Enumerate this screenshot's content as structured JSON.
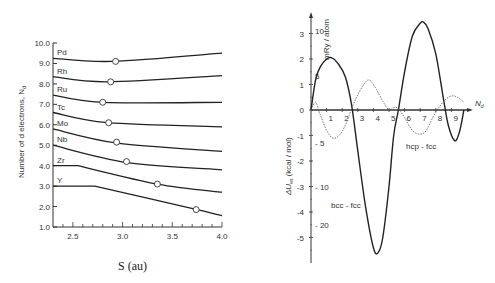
{
  "chart_data": [
    {
      "type": "line",
      "title": "",
      "xlabel": "S (au)",
      "ylabel": "Number of d electrons, N_d",
      "xlim": [
        2.3,
        4.0
      ],
      "ylim": [
        1.0,
        10.0
      ],
      "xticks": [
        "2.5",
        "3.0",
        "3.5",
        "4.0"
      ],
      "yticks": [
        "1.0",
        "2.0",
        "3.0",
        "4.0",
        "5.0",
        "6.0",
        "7.0",
        "8.0",
        "9.0",
        "10.0"
      ],
      "grid": false,
      "series": [
        {
          "name": "Pd",
          "x": [
            2.3,
            2.9,
            4.0
          ],
          "y": [
            9.25,
            9.1,
            9.5
          ],
          "marker": {
            "x": 2.93,
            "y": 9.1
          }
        },
        {
          "name": "Rh",
          "x": [
            2.3,
            2.85,
            4.0
          ],
          "y": [
            8.35,
            8.1,
            8.4
          ],
          "marker": {
            "x": 2.88,
            "y": 8.1
          }
        },
        {
          "name": "Ru",
          "x": [
            2.3,
            2.8,
            4.0
          ],
          "y": [
            7.45,
            7.1,
            7.1
          ],
          "marker": {
            "x": 2.8,
            "y": 7.1
          }
        },
        {
          "name": "Tc",
          "x": [
            2.3,
            2.85,
            4.0
          ],
          "y": [
            6.6,
            6.1,
            5.9
          ],
          "marker": {
            "x": 2.86,
            "y": 6.1
          }
        },
        {
          "name": "Mo",
          "x": [
            2.3,
            2.95,
            4.0
          ],
          "y": [
            5.8,
            5.1,
            4.7
          ],
          "marker": {
            "x": 2.94,
            "y": 5.15
          }
        },
        {
          "name": "Nb",
          "x": [
            2.3,
            3.05,
            4.0
          ],
          "y": [
            5.0,
            4.15,
            3.8
          ],
          "marker": {
            "x": 3.04,
            "y": 4.2
          }
        },
        {
          "name": "Zr",
          "x": [
            2.3,
            2.55,
            3.35,
            4.0
          ],
          "y": [
            4.0,
            4.0,
            3.1,
            2.7
          ],
          "marker": {
            "x": 3.35,
            "y": 3.1
          }
        },
        {
          "name": "Y",
          "x": [
            2.3,
            2.72,
            3.75,
            4.0
          ],
          "y": [
            3.0,
            3.0,
            1.85,
            1.55
          ],
          "marker": {
            "x": 3.74,
            "y": 1.85
          }
        }
      ]
    },
    {
      "type": "line",
      "title": "",
      "xlabel": "N_d",
      "ylabel": "ΔU_es (kcal / mol)",
      "ylabel_secondary": "mRy / atom",
      "xlim": [
        0,
        10
      ],
      "ylim": [
        -5.8,
        3.5
      ],
      "xticks": [
        "1",
        "2",
        "3",
        "4",
        "5",
        "6",
        "7",
        "8",
        "9"
      ],
      "yticks": [
        "3",
        "2",
        "1",
        "0",
        "-1",
        "-2",
        "-3",
        "-4",
        "-5"
      ],
      "yticks_secondary": [
        "10",
        "5",
        "-5",
        "-10",
        "-20"
      ],
      "grid": false,
      "annotations": [
        "bcc - fcc",
        "hcp - fcc"
      ],
      "series": [
        {
          "name": "bcc - fcc",
          "style": "solid",
          "x": [
            0,
            0.3,
            0.6,
            1.0,
            1.3,
            1.7,
            2.2,
            2.6,
            3.0,
            3.5,
            4.0,
            4.3,
            4.6,
            5.0,
            5.3,
            5.6,
            6.0,
            6.5,
            7.0,
            7.2,
            7.5,
            8.0,
            8.5,
            8.8,
            9.2,
            9.5,
            9.8
          ],
          "y": [
            0,
            1.2,
            1.7,
            2.0,
            2.05,
            1.85,
            1.3,
            0.2,
            -1.6,
            -3.8,
            -5.4,
            -5.6,
            -5.0,
            -3.0,
            -1.0,
            0.0,
            1.5,
            2.9,
            3.4,
            3.45,
            3.2,
            2.2,
            0.4,
            -0.6,
            -1.2,
            -0.9,
            0.0
          ]
        },
        {
          "name": "hcp - fcc",
          "style": "dotted",
          "x": [
            0,
            0.3,
            0.6,
            1.0,
            1.4,
            1.8,
            2.2,
            2.6,
            3.0,
            3.5,
            3.8,
            4.2,
            4.6,
            5.0,
            5.3,
            5.6,
            6.0,
            6.5,
            7.0,
            7.4,
            7.8,
            8.2,
            8.6,
            9.0,
            9.4,
            9.8
          ],
          "y": [
            0,
            0.3,
            -0.2,
            -0.8,
            -1.1,
            -1.0,
            -0.6,
            0.05,
            0.6,
            1.1,
            1.15,
            0.8,
            0.35,
            0.0,
            0.1,
            0.05,
            -0.3,
            -0.8,
            -0.95,
            -0.8,
            -0.3,
            0.1,
            0.4,
            0.55,
            0.5,
            0.3
          ]
        }
      ]
    }
  ],
  "left": {
    "ylabel": "Number of d electrons, N",
    "ylabel_sub": "d",
    "xlabel": "S (au)",
    "yticks": [
      "10.0",
      "9.0",
      "8.0",
      "7.0",
      "6.0",
      "5.0",
      "4.0",
      "3.0",
      "2.0",
      "1.0"
    ],
    "xticks": [
      "2.5",
      "3.0",
      "3.5",
      "4.0"
    ],
    "elements": [
      "Pd",
      "Rh",
      "Ru",
      "Tc",
      "Mo",
      "Nb",
      "Zr",
      "Y"
    ]
  },
  "right": {
    "ylabel": "ΔU",
    "ylabel_sub": "es",
    "ylabel_units": "(kcal / mol)",
    "ylabel2": "mRy / atom",
    "xlabel": "N",
    "xlabel_sub": "d",
    "yticks": [
      "3",
      "2",
      "1",
      "0",
      "-1",
      "-2",
      "-3",
      "-4",
      "-5"
    ],
    "yticks2": [
      "10",
      "5",
      "- 5",
      "- 10",
      "- 20"
    ],
    "xticks": [
      "1",
      "2",
      "3",
      "4",
      "5",
      "6",
      "7",
      "8",
      "9"
    ],
    "annot_bcc": "bcc - fcc",
    "annot_hcp": "hcp - fcc"
  }
}
